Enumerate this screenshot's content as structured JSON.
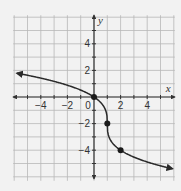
{
  "chart_data": {
    "type": "line",
    "title": "",
    "xlabel": "x",
    "ylabel": "y",
    "xlim": [
      -6,
      6
    ],
    "ylim": [
      -6,
      6
    ],
    "grid": true,
    "grid_step": 1,
    "x_ticks": [
      -4,
      -2,
      0,
      2,
      4
    ],
    "x_tick_labels": [
      "−4",
      "−2",
      "0",
      "2",
      "4"
    ],
    "y_ticks": [
      4,
      2,
      -2,
      -4
    ],
    "y_tick_labels": [
      "4",
      "2",
      "−2",
      "−4"
    ],
    "origin_label": "0",
    "series": [
      {
        "name": "f(x) = -2∛(x - 1) - 2",
        "style": "curve with arrows at both ends",
        "x": [
          -5.8,
          -5,
          -4,
          -3,
          -2,
          -1,
          0,
          0.5,
          0.9,
          1,
          1.1,
          1.5,
          2,
          3,
          4,
          5,
          5.9
        ],
        "y": [
          1.79,
          1.63,
          1.42,
          1.17,
          0.88,
          0.52,
          0,
          -0.41,
          -1.07,
          -2,
          -2.93,
          -3.59,
          -4,
          -4.52,
          -4.88,
          -5.17,
          -5.4
        ]
      }
    ],
    "marked_points": [
      {
        "x": 0,
        "y": 0
      },
      {
        "x": 1,
        "y": -2
      },
      {
        "x": 2,
        "y": -4
      }
    ]
  },
  "colors": {
    "background": "#f2f2f2",
    "grid": "#b8b8b8",
    "axis": "#333333",
    "curve": "#2a2a2a",
    "point": "#1a1a1a"
  }
}
